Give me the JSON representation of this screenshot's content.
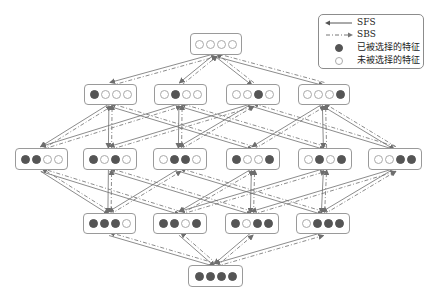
{
  "legend": {
    "items": [
      {
        "key": "sfs",
        "symbol": "solid-arrow-left",
        "label": "SFS"
      },
      {
        "key": "sbs",
        "symbol": "dashdot-arrow-right",
        "label": "SBS"
      },
      {
        "key": "selected",
        "symbol": "filled-circle",
        "label": "已被选择的特征"
      },
      {
        "key": "unselected",
        "symbol": "empty-circle",
        "label": "未被选择的特征"
      }
    ]
  },
  "colors": {
    "line": "#6e6e6e",
    "node_border": "#9a9a9a",
    "selected_dot": "#555555",
    "unselected_dot_border": "#a9a9a9"
  },
  "layers": [
    {
      "level": 0,
      "nodes": [
        {
          "id": "0000",
          "x": 190,
          "y": 33,
          "w": 52,
          "h": 22,
          "state": [
            0,
            0,
            0,
            0
          ]
        }
      ]
    },
    {
      "level": 1,
      "nodes": [
        {
          "id": "1000",
          "x": 84,
          "y": 84,
          "w": 53,
          "h": 21,
          "state": [
            1,
            0,
            0,
            0
          ]
        },
        {
          "id": "0100",
          "x": 154,
          "y": 84,
          "w": 53,
          "h": 21,
          "state": [
            0,
            1,
            0,
            0
          ]
        },
        {
          "id": "0010",
          "x": 226,
          "y": 84,
          "w": 54,
          "h": 21,
          "state": [
            0,
            0,
            1,
            0
          ]
        },
        {
          "id": "0001",
          "x": 298,
          "y": 84,
          "w": 52,
          "h": 21,
          "state": [
            0,
            0,
            0,
            1
          ]
        }
      ]
    },
    {
      "level": 2,
      "nodes": [
        {
          "id": "1100",
          "x": 15,
          "y": 148,
          "w": 53,
          "h": 22,
          "state": [
            1,
            1,
            0,
            0
          ]
        },
        {
          "id": "1010",
          "x": 83,
          "y": 148,
          "w": 54,
          "h": 22,
          "state": [
            1,
            0,
            1,
            0
          ]
        },
        {
          "id": "0110",
          "x": 153,
          "y": 148,
          "w": 54,
          "h": 22,
          "state": [
            0,
            1,
            1,
            0
          ]
        },
        {
          "id": "1001",
          "x": 226,
          "y": 148,
          "w": 54,
          "h": 22,
          "state": [
            1,
            0,
            0,
            1
          ]
        },
        {
          "id": "0101",
          "x": 298,
          "y": 148,
          "w": 54,
          "h": 22,
          "state": [
            0,
            1,
            0,
            1
          ]
        },
        {
          "id": "0011",
          "x": 368,
          "y": 148,
          "w": 54,
          "h": 22,
          "state": [
            0,
            0,
            1,
            1
          ]
        }
      ]
    },
    {
      "level": 3,
      "nodes": [
        {
          "id": "1110",
          "x": 83,
          "y": 213,
          "w": 53,
          "h": 21,
          "state": [
            1,
            1,
            1,
            0
          ]
        },
        {
          "id": "1101",
          "x": 153,
          "y": 213,
          "w": 54,
          "h": 21,
          "state": [
            1,
            1,
            0,
            1
          ]
        },
        {
          "id": "1011",
          "x": 225,
          "y": 213,
          "w": 54,
          "h": 21,
          "state": [
            1,
            0,
            1,
            1
          ]
        },
        {
          "id": "0111",
          "x": 296,
          "y": 213,
          "w": 54,
          "h": 21,
          "state": [
            0,
            1,
            1,
            1
          ]
        }
      ]
    },
    {
      "level": 4,
      "nodes": [
        {
          "id": "1111",
          "x": 188,
          "y": 265,
          "w": 55,
          "h": 22,
          "state": [
            1,
            1,
            1,
            1
          ]
        }
      ]
    }
  ]
}
